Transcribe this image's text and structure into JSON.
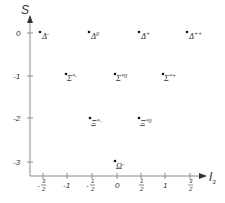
{
  "diagram": {
    "axes": {
      "y_axis": {
        "label": "S",
        "ticks": [
          "0",
          "-1",
          "-2",
          "-3"
        ]
      },
      "x_axis": {
        "label": "I",
        "label_subscript": "3",
        "ticks": [
          {
            "whole": "-",
            "num": "3",
            "den": "2",
            "value": "-3/2"
          },
          {
            "whole": "-1",
            "value": "-1"
          },
          {
            "whole": "-",
            "num": "1",
            "den": "2",
            "value": "-1/2"
          },
          {
            "whole": "0",
            "value": "0"
          },
          {
            "whole": "",
            "num": "1",
            "den": "2",
            "value": "1/2"
          },
          {
            "whole": "1",
            "value": "1"
          },
          {
            "whole": "",
            "num": "3",
            "den": "2",
            "value": "3/2"
          }
        ]
      }
    },
    "particles": [
      {
        "symbol": "Δ",
        "charge": "-",
        "I3": -1.5,
        "S": 0
      },
      {
        "symbol": "Δ",
        "charge": "0",
        "I3": -0.5,
        "S": 0
      },
      {
        "symbol": "Δ",
        "charge": "+",
        "I3": 0.5,
        "S": 0
      },
      {
        "symbol": "Δ",
        "charge": "++",
        "I3": 1.5,
        "S": 0
      },
      {
        "symbol": "Σ",
        "charge": "*-",
        "I3": -1,
        "S": -1
      },
      {
        "symbol": "Σ",
        "charge": "*0",
        "I3": 0,
        "S": -1
      },
      {
        "symbol": "Σ",
        "charge": "*+",
        "I3": 1,
        "S": -1
      },
      {
        "symbol": "Ξ",
        "charge": "*-",
        "I3": -0.5,
        "S": -2
      },
      {
        "symbol": "Ξ",
        "charge": "*0",
        "I3": 0.5,
        "S": -2
      },
      {
        "symbol": "Ω",
        "charge": "-",
        "I3": 0,
        "S": -3
      }
    ],
    "colors": {
      "axis": "#8a8a8a",
      "text": "#333333",
      "dot": "#111111"
    }
  }
}
